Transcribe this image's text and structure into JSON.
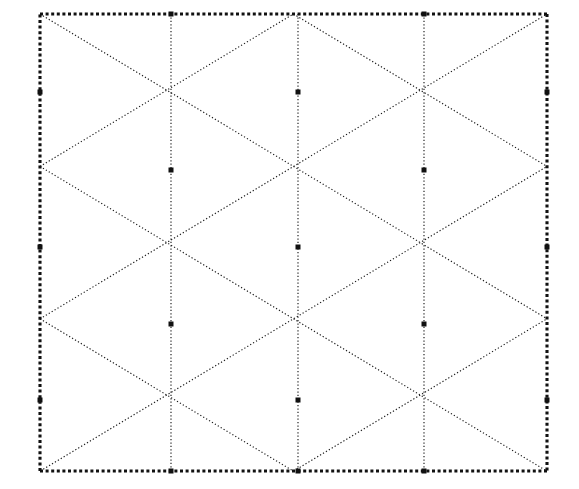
{
  "figure": {
    "background_color": "#ffffff",
    "line_color": "#1a1a1a",
    "boundary_color": "#111111",
    "line_style": "dotted",
    "boundary_style": "dotted-thick"
  },
  "chart_data": {
    "type": "diagram",
    "xlabel": "",
    "ylabel": "",
    "grid": true,
    "legend": "none",
    "canvas": {
      "width": 579,
      "height": 489
    },
    "boundary": {
      "x0": 40,
      "y0": 14,
      "x1": 547,
      "y1": 471,
      "width": 507,
      "height": 457
    },
    "lattice": {
      "column_spacing": 126.75,
      "row_spacing": 76.2,
      "column_x": [
        40,
        171,
        298,
        424,
        547
      ],
      "row_y": [
        14,
        92,
        170,
        247,
        324,
        400,
        471
      ],
      "vertical_line_x": [
        171,
        298,
        424
      ],
      "interior_vertices": [
        {
          "x": 171,
          "y": 170
        },
        {
          "x": 298,
          "y": 92
        },
        {
          "x": 298,
          "y": 247
        },
        {
          "x": 424,
          "y": 170
        },
        {
          "x": 171,
          "y": 324
        },
        {
          "x": 424,
          "y": 324
        },
        {
          "x": 298,
          "y": 400
        }
      ],
      "edge_vertices": [
        {
          "x": 40,
          "y": 92
        },
        {
          "x": 40,
          "y": 247
        },
        {
          "x": 40,
          "y": 400
        },
        {
          "x": 547,
          "y": 92
        },
        {
          "x": 547,
          "y": 247
        },
        {
          "x": 547,
          "y": 400
        },
        {
          "x": 171,
          "y": 14
        },
        {
          "x": 424,
          "y": 14
        },
        {
          "x": 171,
          "y": 471
        },
        {
          "x": 298,
          "y": 471
        },
        {
          "x": 424,
          "y": 471
        }
      ]
    },
    "counts": {
      "vertical_lines": 3,
      "diagonal_direction_a": 7,
      "diagonal_direction_b": 7,
      "boundary_edges": 4
    }
  }
}
